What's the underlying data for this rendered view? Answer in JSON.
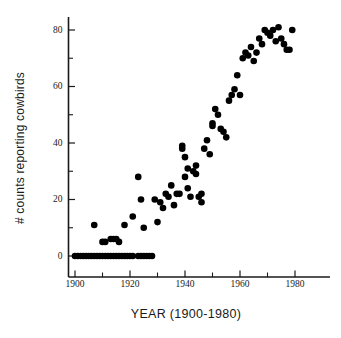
{
  "chart_data": {
    "type": "scatter",
    "title": "",
    "xlabel": "YEAR (1900-1980)",
    "ylabel": "# counts reporting cowbirds",
    "xlim": [
      1897,
      1989
    ],
    "ylim": [
      -3,
      85
    ],
    "grid": false,
    "legend": null,
    "xticks": [
      1900,
      1920,
      1940,
      1960,
      1980
    ],
    "xtick_labels": [
      "1900",
      "1920",
      "1940",
      "1960",
      "1980"
    ],
    "xminorticks": [
      1910,
      1930,
      1950,
      1970
    ],
    "yticks": [
      0,
      20,
      40,
      60,
      80
    ],
    "ytick_labels": [
      "0",
      "20",
      "40",
      "60",
      "80"
    ],
    "yminorticks": [
      10,
      30,
      50,
      70
    ],
    "marker": "filled-circle",
    "marker_color": "#000000",
    "marker_size": 3.3,
    "series": [
      {
        "name": "counts reporting cowbirds",
        "points": [
          [
            1900,
            0
          ],
          [
            1901,
            0
          ],
          [
            1902,
            0
          ],
          [
            1903,
            0
          ],
          [
            1904,
            0
          ],
          [
            1905,
            0
          ],
          [
            1906,
            0
          ],
          [
            1907,
            0
          ],
          [
            1908,
            0
          ],
          [
            1909,
            0
          ],
          [
            1910,
            0
          ],
          [
            1911,
            0
          ],
          [
            1912,
            0
          ],
          [
            1913,
            0
          ],
          [
            1914,
            0
          ],
          [
            1915,
            0
          ],
          [
            1916,
            0
          ],
          [
            1917,
            0
          ],
          [
            1918,
            0
          ],
          [
            1919,
            0
          ],
          [
            1920,
            0
          ],
          [
            1921,
            0
          ],
          [
            1923,
            0
          ],
          [
            1924,
            0
          ],
          [
            1925,
            0
          ],
          [
            1926,
            0
          ],
          [
            1927,
            0
          ],
          [
            1928,
            0
          ],
          [
            1907,
            11
          ],
          [
            1910,
            5
          ],
          [
            1911,
            5
          ],
          [
            1913,
            6
          ],
          [
            1914,
            6
          ],
          [
            1915,
            6
          ],
          [
            1916,
            5
          ],
          [
            1918,
            11
          ],
          [
            1921,
            14
          ],
          [
            1923,
            28
          ],
          [
            1924,
            20
          ],
          [
            1925,
            10
          ],
          [
            1929,
            20
          ],
          [
            1930,
            12
          ],
          [
            1931,
            19
          ],
          [
            1932,
            17
          ],
          [
            1933,
            22
          ],
          [
            1934,
            21
          ],
          [
            1935,
            25
          ],
          [
            1936,
            18
          ],
          [
            1937,
            22
          ],
          [
            1938,
            22
          ],
          [
            1939,
            39
          ],
          [
            1939,
            38
          ],
          [
            1940,
            35
          ],
          [
            1940,
            28
          ],
          [
            1941,
            24
          ],
          [
            1941,
            31
          ],
          [
            1942,
            21
          ],
          [
            1943,
            30
          ],
          [
            1944,
            32
          ],
          [
            1944,
            29
          ],
          [
            1945,
            21
          ],
          [
            1946,
            22
          ],
          [
            1946,
            19
          ],
          [
            1947,
            38
          ],
          [
            1948,
            41
          ],
          [
            1949,
            36
          ],
          [
            1950,
            46
          ],
          [
            1950,
            47
          ],
          [
            1951,
            52
          ],
          [
            1952,
            50
          ],
          [
            1953,
            45
          ],
          [
            1954,
            44
          ],
          [
            1955,
            42
          ],
          [
            1956,
            55
          ],
          [
            1957,
            57
          ],
          [
            1958,
            59
          ],
          [
            1959,
            64
          ],
          [
            1960,
            57
          ],
          [
            1961,
            70
          ],
          [
            1962,
            72
          ],
          [
            1963,
            71
          ],
          [
            1964,
            74
          ],
          [
            1965,
            69
          ],
          [
            1966,
            72
          ],
          [
            1967,
            77
          ],
          [
            1968,
            75
          ],
          [
            1969,
            80
          ],
          [
            1970,
            79
          ],
          [
            1971,
            78
          ],
          [
            1972,
            80
          ],
          [
            1973,
            76
          ],
          [
            1974,
            81
          ],
          [
            1975,
            77
          ],
          [
            1976,
            75
          ],
          [
            1977,
            73
          ],
          [
            1978,
            73
          ],
          [
            1979,
            80
          ]
        ]
      }
    ]
  },
  "axes": {
    "x_title": "YEAR (1900-1980)",
    "y_title": "# counts reporting cowbirds"
  }
}
